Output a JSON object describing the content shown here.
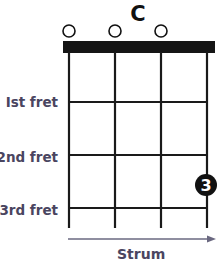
{
  "chord": {
    "name": "C",
    "open_strings": [
      1,
      2,
      3
    ],
    "fingering": [
      {
        "string": 4,
        "fret": 3,
        "finger": "3"
      }
    ]
  },
  "fret_labels": [
    "Ist fret",
    "2nd fret",
    "3rd fret"
  ],
  "strum_label": "Strum",
  "colors": {
    "grid": "#1a1a1a",
    "label": "#4a4560",
    "arrow": "#6a6880",
    "finger_dot": "#111111"
  }
}
